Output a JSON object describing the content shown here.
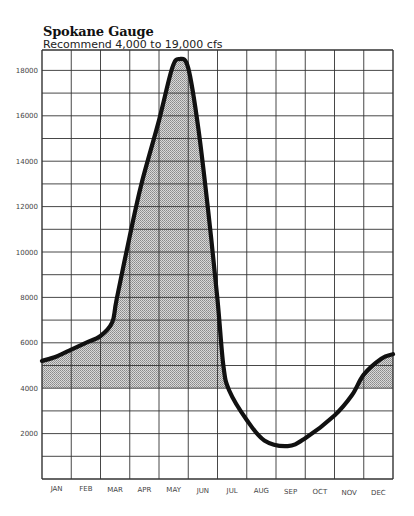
{
  "chart_data": {
    "type": "area",
    "title": "Spokane Gauge",
    "subtitle": "Recommend 4,000 to 19,000 cfs",
    "xlabel": "",
    "ylabel": "cfs",
    "categories": [
      "JAN",
      "FEB",
      "MAR",
      "APR",
      "MAY",
      "JUN",
      "JUL",
      "AUG",
      "SEP",
      "OCT",
      "NOV",
      "DEC"
    ],
    "series": [
      {
        "name": "Flow (cfs)",
        "values": [
          5400,
          6000,
          7500,
          13200,
          18200,
          14000,
          3800,
          1800,
          1500,
          2200,
          3500,
          5200
        ]
      }
    ],
    "curve_points": [
      [
        0.0,
        5200
      ],
      [
        0.5,
        5400
      ],
      [
        1.0,
        5700
      ],
      [
        1.5,
        6000
      ],
      [
        2.0,
        6300
      ],
      [
        2.4,
        6900
      ],
      [
        2.55,
        7900
      ],
      [
        3.0,
        10700
      ],
      [
        3.4,
        13000
      ],
      [
        4.0,
        15800
      ],
      [
        4.45,
        18100
      ],
      [
        4.7,
        18500
      ],
      [
        5.0,
        18100
      ],
      [
        5.35,
        15400
      ],
      [
        5.7,
        11600
      ],
      [
        6.0,
        7900
      ],
      [
        6.2,
        5000
      ],
      [
        6.4,
        3900
      ],
      [
        7.0,
        2600
      ],
      [
        7.6,
        1700
      ],
      [
        8.4,
        1450
      ],
      [
        9.0,
        1800
      ],
      [
        10.0,
        2800
      ],
      [
        10.6,
        3700
      ],
      [
        11.0,
        4600
      ],
      [
        11.6,
        5300
      ],
      [
        12.0,
        5500
      ]
    ],
    "shaded_threshold": 4000,
    "recommended_range": [
      4000,
      19000
    ],
    "yticks": [
      2000,
      4000,
      6000,
      8000,
      10000,
      12000,
      14000,
      16000,
      18000
    ],
    "ylim": [
      0,
      19000
    ],
    "grid": true,
    "grid_y_step": 1000,
    "legend": "none"
  },
  "header": {
    "title": "Spokane Gauge",
    "subtitle": "Recommend 4,000 to 19,000 cfs"
  },
  "axis": {
    "y_labels": [
      "2000",
      "4000",
      "6000",
      "8000",
      "10000",
      "12000",
      "14000",
      "16000",
      "18000"
    ],
    "x_labels": [
      "JAN",
      "FEB",
      "MAR",
      "APR",
      "MAY",
      "JUN",
      "JUL",
      "AUG",
      "SEP",
      "OCT",
      "NOV",
      "DEC"
    ]
  },
  "colors": {
    "line": "#111111",
    "shade": "#b8b8b8",
    "grid": "#333333"
  }
}
